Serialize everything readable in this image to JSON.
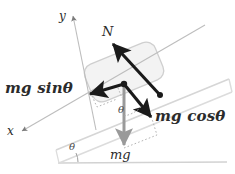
{
  "figure": {
    "type": "free-body-diagram",
    "background_color": "#ffffff"
  },
  "colors": {
    "incline_line": "#d6d6d6",
    "ground_line": "#d2d2d2",
    "block_fill": "#f2f2f2",
    "block_stroke": "#cfcfcf",
    "axis_line": "#b9b9b9",
    "force_arrow": "#1a1a1a",
    "weight_arrow": "#9a9a9a",
    "dotted_guide": "#b0b0b0",
    "text": "#2b2b2b"
  },
  "axes": [
    {
      "id": "y-axis",
      "label": "y",
      "direction": "up-right",
      "label_x": 59,
      "label_y": 11
    },
    {
      "id": "x-axis",
      "label": "x",
      "direction": "down-left",
      "label_x": 7,
      "label_y": 126
    }
  ],
  "vectors": [
    {
      "id": "normal-force",
      "label": "N",
      "meaning": "normal force",
      "color": "#1a1a1a",
      "style": "solid-thick",
      "from": [
        160,
        95
      ],
      "to": [
        112,
        43
      ],
      "label_x": 103,
      "label_y": 26
    },
    {
      "id": "gravity-parallel",
      "label": "mg sinθ",
      "meaning": "component of weight parallel to incline",
      "color": "#1a1a1a",
      "style": "solid-thick",
      "from": [
        124,
        84
      ],
      "to": [
        88,
        95
      ],
      "label_x": 6,
      "label_y": 82
    },
    {
      "id": "gravity-perpendicular",
      "label": "mg cosθ",
      "meaning": "component of weight perpendicular to incline",
      "color": "#1a1a1a",
      "style": "solid-thick",
      "from": [
        124,
        84
      ],
      "to": [
        153,
        119
      ],
      "label_x": 156,
      "label_y": 110
    },
    {
      "id": "weight",
      "label": "mg",
      "meaning": "weight (gravitational force)",
      "color": "#9a9a9a",
      "style": "solid-medium",
      "from": [
        124,
        84
      ],
      "to": [
        124,
        148
      ],
      "label_x": 110,
      "label_y": 148
    }
  ],
  "angles": [
    {
      "id": "incline-angle",
      "label": "θ",
      "location": "between incline surface and ground",
      "label_x": 70,
      "label_y": 143
    },
    {
      "id": "component-angle",
      "label": "θ",
      "location": "between weight vector and perpendicular component",
      "label_x": 119,
      "label_y": 106
    }
  ],
  "shapes": [
    {
      "id": "block",
      "kind": "rounded-rectangle",
      "description": "block resting on incline"
    },
    {
      "id": "incline",
      "kind": "ramp",
      "description": "inclined plane surface"
    },
    {
      "id": "ground",
      "kind": "line",
      "description": "horizontal ground reference line"
    }
  ]
}
